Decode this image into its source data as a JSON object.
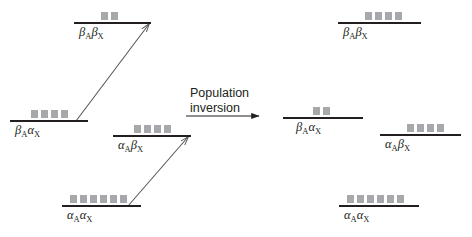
{
  "figure": {
    "title_text": "",
    "background_color": "#ffffff",
    "line_color": "#231f20",
    "population_marker_color": "#a6a8ab",
    "arrow_color": "#58595b"
  },
  "transition_caption": {
    "line1": "Population",
    "line2": "inversion"
  },
  "left_panel": {
    "name": "before-inversion",
    "levels": [
      {
        "id": "left-beta-a-beta-x",
        "greek_a": "β",
        "sub_a": "A",
        "greek_x": "β",
        "sub_x": "X",
        "label_plain": "βAβX",
        "population": 2,
        "line_x": 74,
        "line_y": 22,
        "line_width": 77,
        "label_x": 79,
        "label_y": 26,
        "squares_x": 101,
        "squares_y": 12
      },
      {
        "id": "left-beta-a-alpha-x",
        "greek_a": "β",
        "sub_a": "A",
        "greek_x": "α",
        "sub_x": "X",
        "label_plain": "βAαX",
        "population": 4,
        "line_x": 10,
        "line_y": 120,
        "line_width": 78,
        "label_x": 15,
        "label_y": 124,
        "squares_x": 31,
        "squares_y": 110
      },
      {
        "id": "left-alpha-a-beta-x",
        "greek_a": "α",
        "sub_a": "A",
        "greek_x": "β",
        "sub_x": "X",
        "label_plain": "αAβX",
        "population": 4,
        "line_x": 113,
        "line_y": 135,
        "line_width": 78,
        "label_x": 118,
        "label_y": 139,
        "squares_x": 134,
        "squares_y": 125
      },
      {
        "id": "left-alpha-a-alpha-x",
        "greek_a": "α",
        "sub_a": "A",
        "greek_x": "α",
        "sub_x": "X",
        "label_plain": "αAαX",
        "population": 6,
        "line_x": 62,
        "line_y": 205,
        "line_width": 79,
        "label_x": 67,
        "label_y": 209,
        "squares_x": 70,
        "squares_y": 195
      }
    ],
    "transition_arrows": [
      {
        "id": "arrow-beta-a-alpha-x-to-beta-a-beta-x",
        "x1": 76,
        "y1": 121,
        "x2": 149,
        "y2": 24
      },
      {
        "id": "arrow-alpha-a-alpha-x-to-alpha-a-beta-x",
        "x1": 128,
        "y1": 206,
        "x2": 188,
        "y2": 137
      }
    ]
  },
  "right_panel": {
    "name": "after-inversion",
    "levels": [
      {
        "id": "right-beta-a-beta-x",
        "greek_a": "β",
        "sub_a": "A",
        "greek_x": "β",
        "sub_x": "X",
        "label_plain": "βAβX",
        "population": 4,
        "line_x": 338,
        "line_y": 22,
        "line_width": 83,
        "label_x": 343,
        "label_y": 26,
        "squares_x": 365,
        "squares_y": 12
      },
      {
        "id": "right-beta-a-alpha-x",
        "greek_a": "β",
        "sub_a": "A",
        "greek_x": "α",
        "sub_x": "X",
        "label_plain": "βAαX",
        "population": 2,
        "line_x": 283,
        "line_y": 117,
        "line_width": 80,
        "label_x": 296,
        "label_y": 121,
        "squares_x": 313,
        "squares_y": 107
      },
      {
        "id": "right-alpha-a-beta-x",
        "greek_a": "α",
        "sub_a": "A",
        "greek_x": "β",
        "sub_x": "X",
        "label_plain": "αAβX",
        "population": 4,
        "line_x": 380,
        "line_y": 134,
        "line_width": 81,
        "label_x": 385,
        "label_y": 138,
        "squares_x": 407,
        "squares_y": 124
      },
      {
        "id": "right-alpha-a-alpha-x",
        "greek_a": "α",
        "sub_a": "A",
        "greek_x": "α",
        "sub_x": "X",
        "label_plain": "αAαX",
        "population": 6,
        "line_x": 339,
        "line_y": 205,
        "line_width": 80,
        "label_x": 344,
        "label_y": 209,
        "squares_x": 347,
        "squares_y": 195
      }
    ]
  },
  "inversion_arrow": {
    "id": "population-inversion-arrow",
    "x1": 186,
    "y1": 116,
    "x2": 259,
    "y2": 116
  }
}
